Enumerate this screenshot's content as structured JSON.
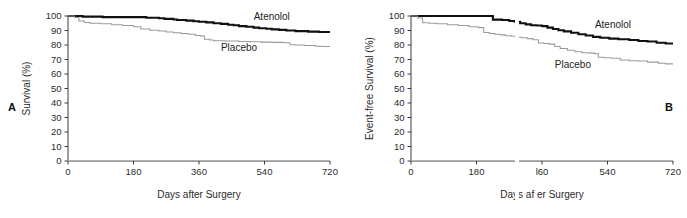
{
  "figure": {
    "panel_a_letter": "A",
    "panel_b_letter": "B"
  },
  "chart_data": [
    {
      "id": "panel-a",
      "type": "line",
      "subtype": "kaplan-meier-step",
      "panel_label": "A",
      "title": "",
      "xlabel": "Days after Surgery",
      "ylabel": "Survival (%)",
      "xlim": [
        0,
        720
      ],
      "ylim": [
        0,
        100
      ],
      "xticks": [
        0,
        180,
        360,
        540,
        720
      ],
      "xtick_labels": [
        "0",
        "180",
        "360",
        "540",
        "720"
      ],
      "yticks": [
        0,
        10,
        20,
        30,
        40,
        50,
        60,
        70,
        80,
        90,
        100
      ],
      "ytick_labels": [
        "0",
        "10",
        "20",
        "30",
        "40",
        "50",
        "60",
        "70",
        "80",
        "90",
        "100"
      ],
      "grid": false,
      "legend_position": "inline-right-annotation",
      "series": [
        {
          "name": "Atenolol",
          "style": "thick-black",
          "color": "#111111",
          "label_x": 560,
          "label_y": 97,
          "x": [
            0,
            25,
            40,
            60,
            95,
            140,
            180,
            215,
            250,
            265,
            290,
            300,
            325,
            345,
            360,
            380,
            400,
            420,
            440,
            455,
            470,
            490,
            510,
            525,
            545,
            560,
            580,
            600,
            625,
            660,
            690,
            720
          ],
          "y": [
            100,
            100,
            99.6,
            99.6,
            99.2,
            99.2,
            99.2,
            98.8,
            98.4,
            98.0,
            97.6,
            97.2,
            96.8,
            96.4,
            96.0,
            95.6,
            95.0,
            94.6,
            94.0,
            93.6,
            93.0,
            92.6,
            92.0,
            91.6,
            91.2,
            90.8,
            90.4,
            90.0,
            89.6,
            89.2,
            89.0,
            89.0
          ]
        },
        {
          "name": "Placebo",
          "style": "thin-gray",
          "color": "#9a9a9a",
          "label_x": 470,
          "label_y": 76,
          "x": [
            0,
            18,
            30,
            45,
            60,
            90,
            120,
            150,
            180,
            200,
            225,
            250,
            270,
            290,
            310,
            330,
            350,
            365,
            375,
            390,
            400,
            430,
            470,
            500,
            530,
            560,
            590,
            610,
            625,
            650,
            680,
            700,
            720
          ],
          "y": [
            100,
            99,
            96.5,
            95.5,
            95.0,
            94.6,
            94.0,
            93.4,
            92.6,
            91.0,
            90.2,
            89.6,
            89.0,
            88.4,
            88.0,
            87.4,
            86.6,
            86.2,
            84.0,
            83.4,
            83.0,
            82.8,
            82.4,
            82.2,
            82.0,
            81.8,
            81.6,
            80.2,
            80.0,
            79.6,
            79.2,
            79.0,
            79.0
          ]
        }
      ]
    },
    {
      "id": "panel-b",
      "type": "line",
      "subtype": "kaplan-meier-step",
      "panel_label": "B",
      "title": "",
      "xlabel": "Days af er Surgery",
      "xlabel_note": "scan artifact erased the 't' in 'after'",
      "ylabel": "Event-free Survival (%)",
      "xlim": [
        0,
        720
      ],
      "ylim": [
        0,
        100
      ],
      "xticks": [
        0,
        180,
        360,
        540,
        720
      ],
      "xtick_labels": [
        "0",
        "180",
        "l60",
        "540",
        "720"
      ],
      "xtick_labels_note": "the 360 tick renders as 'l60' due to the vertical scan artifact",
      "yticks": [
        0,
        10,
        20,
        30,
        40,
        50,
        60,
        70,
        80,
        90,
        100
      ],
      "ytick_labels": [
        "0",
        "10",
        "20",
        "30",
        "40",
        "50",
        "60",
        "70",
        "80",
        "90",
        "100"
      ],
      "grid": false,
      "legend_position": "inline-right-annotation",
      "series": [
        {
          "name": "Atenolol",
          "style": "thick-black",
          "color": "#111111",
          "label_x": 555,
          "label_y": 92,
          "x": [
            0,
            30,
            80,
            140,
            190,
            215,
            225,
            250,
            270,
            285,
            300,
            315,
            330,
            345,
            360,
            375,
            390,
            405,
            420,
            440,
            460,
            480,
            500,
            520,
            545,
            570,
            600,
            625,
            650,
            675,
            700,
            720
          ],
          "y": [
            100,
            100,
            100,
            100,
            100,
            100,
            97.5,
            97.2,
            96.6,
            96.0,
            95.0,
            94.2,
            93.6,
            93.4,
            93.0,
            92.0,
            91.0,
            90.2,
            89.4,
            88.4,
            87.4,
            86.6,
            85.6,
            85.0,
            84.4,
            84.0,
            83.4,
            82.8,
            82.4,
            81.6,
            81.0,
            81.0
          ]
        },
        {
          "name": "Placebo",
          "style": "thin-gray",
          "color": "#9a9a9a",
          "label_x": 445,
          "label_y": 64,
          "x": [
            0,
            18,
            32,
            50,
            70,
            100,
            130,
            160,
            185,
            200,
            215,
            230,
            245,
            260,
            275,
            290,
            305,
            320,
            335,
            350,
            365,
            380,
            395,
            410,
            430,
            450,
            470,
            490,
            505,
            515,
            530,
            550,
            575,
            600,
            625,
            650,
            680,
            700,
            720
          ],
          "y": [
            100,
            98.6,
            95.4,
            95.0,
            94.6,
            94.0,
            93.4,
            92.6,
            92.0,
            88.6,
            88.0,
            87.4,
            87.0,
            86.4,
            86.0,
            85.4,
            85.0,
            84.4,
            83.6,
            81.4,
            81.0,
            80.6,
            79.0,
            77.6,
            76.4,
            75.4,
            74.6,
            74.4,
            74.0,
            71.6,
            71.2,
            70.8,
            69.6,
            69.2,
            69.0,
            68.2,
            67.4,
            67.0,
            67.0
          ]
        }
      ]
    }
  ]
}
